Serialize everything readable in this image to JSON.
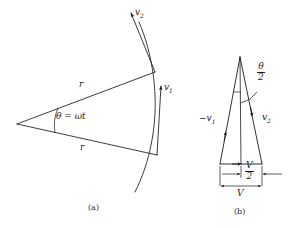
{
  "figure": {
    "panels": [
      {
        "id": "a",
        "caption": "(a)",
        "description": "circular sector with radii, arc and tangential velocity vectors",
        "labels": {
          "angle": "θ = ωt",
          "radius_upper": "r",
          "radius_lower": "r",
          "velocity_1_symbol": "v",
          "velocity_1_subscript": "1",
          "velocity_2_symbol": "v",
          "velocity_2_subscript": "2"
        }
      },
      {
        "id": "b",
        "caption": "(b)",
        "description": "isosceles vector triangle for the velocity change",
        "labels": {
          "half_angle_numerator": "θ",
          "half_angle_denominator": "2",
          "minus_velocity_1_symbol": "−v",
          "minus_velocity_1_subscript": "1",
          "velocity_2_symbol": "v",
          "velocity_2_subscript": "2",
          "half_V_numerator": "V",
          "half_V_denominator": "2",
          "full_V": "V"
        }
      }
    ],
    "colors": {
      "stroke": "#1a1a1a",
      "text": "#1a1a1a",
      "background": "#ffffff"
    }
  }
}
